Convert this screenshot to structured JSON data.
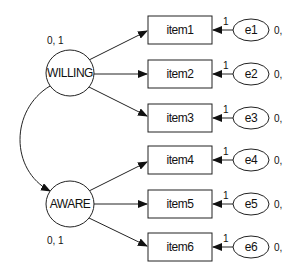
{
  "diagram": {
    "type": "SEM path diagram",
    "latent_variables": [
      {
        "id": "WILLING",
        "label": "WILLING",
        "param": "0, 1",
        "cx": 70,
        "cy": 73
      },
      {
        "id": "AWARE",
        "label": "AWARE",
        "param": "0, 1",
        "cx": 70,
        "cy": 204
      }
    ],
    "observed_variables": [
      {
        "label": "item1",
        "y": 30
      },
      {
        "label": "item2",
        "y": 74
      },
      {
        "label": "item3",
        "y": 118
      },
      {
        "label": "item4",
        "y": 160
      },
      {
        "label": "item5",
        "y": 204
      },
      {
        "label": "item6",
        "y": 247
      }
    ],
    "error_terms": [
      {
        "label": "e1",
        "loading": "1",
        "param": "0,"
      },
      {
        "label": "e2",
        "loading": "1",
        "param": "0,"
      },
      {
        "label": "e3",
        "loading": "1",
        "param": "0,"
      },
      {
        "label": "e4",
        "loading": "1",
        "param": "0,"
      },
      {
        "label": "e5",
        "loading": "1",
        "param": "0,"
      },
      {
        "label": "e6",
        "loading": "1",
        "param": "0,"
      }
    ],
    "paths": [
      {
        "from": "WILLING",
        "to": "item1"
      },
      {
        "from": "WILLING",
        "to": "item2"
      },
      {
        "from": "WILLING",
        "to": "item3"
      },
      {
        "from": "AWARE",
        "to": "item4"
      },
      {
        "from": "AWARE",
        "to": "item5"
      },
      {
        "from": "AWARE",
        "to": "item6"
      },
      {
        "from": "e1",
        "to": "item1"
      },
      {
        "from": "e2",
        "to": "item2"
      },
      {
        "from": "e3",
        "to": "item3"
      },
      {
        "from": "e4",
        "to": "item4"
      },
      {
        "from": "e5",
        "to": "item5"
      },
      {
        "from": "e6",
        "to": "item6"
      }
    ],
    "covariances": [
      {
        "between": [
          "WILLING",
          "AWARE"
        ],
        "style": "curved double-headed arrow"
      }
    ]
  }
}
